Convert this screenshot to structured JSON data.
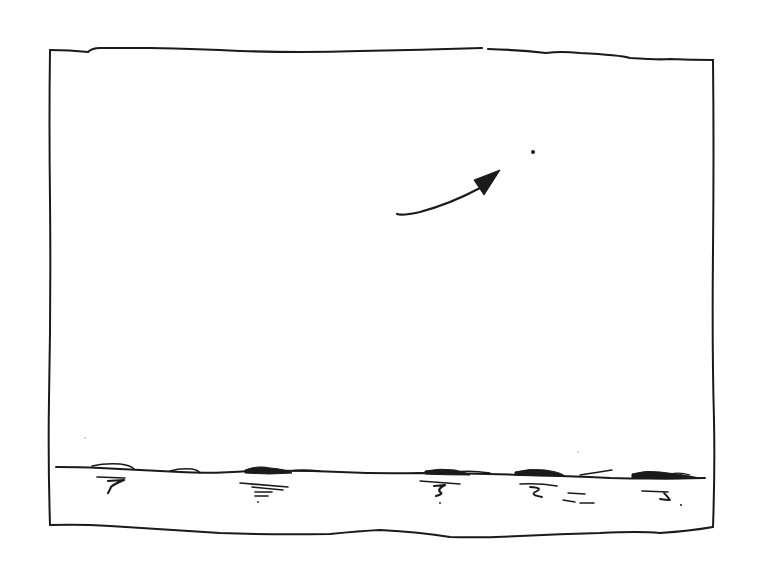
{
  "figure": {
    "description": "Hand-drawn ink sketch: a rectangular frame containing an empty sky, a small distant dot, a curved arrow pointing toward the dot, and a horizon of water/shoreline at the bottom with ripple marks.",
    "frame": {
      "label": "sketch-frame"
    },
    "target_dot": {
      "label": "distant point"
    },
    "arrow": {
      "label": "direction arrow",
      "direction": "up-right toward dot"
    },
    "horizon": {
      "label": "water horizon with ripples"
    }
  },
  "colors": {
    "ink": "#1a1a1a",
    "paper": "#ffffff"
  }
}
